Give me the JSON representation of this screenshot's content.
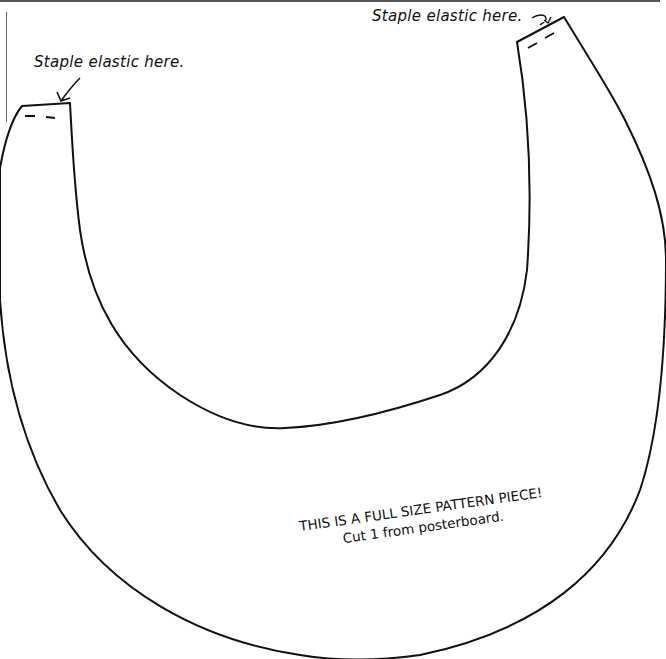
{
  "labels": {
    "left_tab": "Staple elastic here.",
    "right_tab": "Staple elastic here."
  },
  "note": {
    "line1": "THIS IS A FULL SIZE PATTERN PIECE!",
    "line2": "Cut 1 from posterboard."
  },
  "colors": {
    "outline": "#111111",
    "background": "#ffffff"
  }
}
